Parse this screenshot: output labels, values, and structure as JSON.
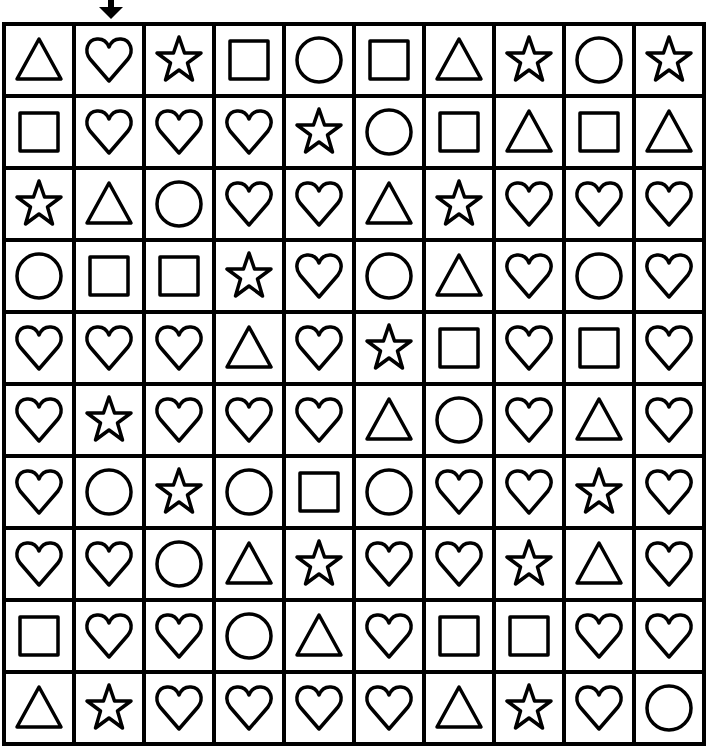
{
  "puzzle": {
    "arrow_column": 2,
    "rows": 10,
    "cols": 10,
    "grid": [
      [
        "triangle",
        "heart",
        "star",
        "square",
        "circle",
        "square",
        "triangle",
        "star",
        "circle",
        "star"
      ],
      [
        "square",
        "heart",
        "heart",
        "heart",
        "star",
        "circle",
        "square",
        "triangle",
        "square",
        "triangle"
      ],
      [
        "star",
        "triangle",
        "circle",
        "heart",
        "heart",
        "triangle",
        "star",
        "heart",
        "heart",
        "heart"
      ],
      [
        "circle",
        "square",
        "square",
        "star",
        "heart",
        "circle",
        "triangle",
        "heart",
        "circle",
        "heart"
      ],
      [
        "heart",
        "heart",
        "heart",
        "triangle",
        "heart",
        "star",
        "square",
        "heart",
        "square",
        "heart"
      ],
      [
        "heart",
        "star",
        "heart",
        "heart",
        "heart",
        "triangle",
        "circle",
        "heart",
        "triangle",
        "heart"
      ],
      [
        "heart",
        "circle",
        "star",
        "circle",
        "square",
        "circle",
        "heart",
        "heart",
        "star",
        "heart"
      ],
      [
        "heart",
        "heart",
        "circle",
        "triangle",
        "star",
        "heart",
        "heart",
        "star",
        "triangle",
        "heart"
      ],
      [
        "square",
        "heart",
        "heart",
        "circle",
        "triangle",
        "heart",
        "square",
        "square",
        "heart",
        "heart"
      ],
      [
        "triangle",
        "star",
        "heart",
        "heart",
        "heart",
        "heart",
        "triangle",
        "star",
        "heart",
        "circle"
      ]
    ]
  },
  "colors": {
    "line": "#000000",
    "background": "#ffffff"
  }
}
